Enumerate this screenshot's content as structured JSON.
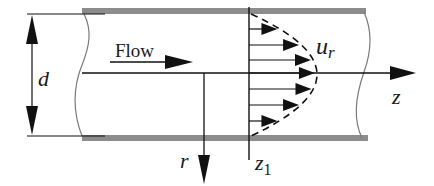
{
  "diagram": {
    "labels": {
      "flow": "Flow",
      "diameter": "d",
      "velocity": "u",
      "velocity_sub": "r",
      "axial_axis": "z",
      "radial_axis": "r",
      "station": "z",
      "station_sub": "1"
    },
    "profile": {
      "shape": "parabolic",
      "arrow_count": 7
    },
    "colors": {
      "ink": "#111111",
      "wall": "#8c8c8c",
      "break_line": "#7a7a7a",
      "background": "#ffffff"
    }
  }
}
